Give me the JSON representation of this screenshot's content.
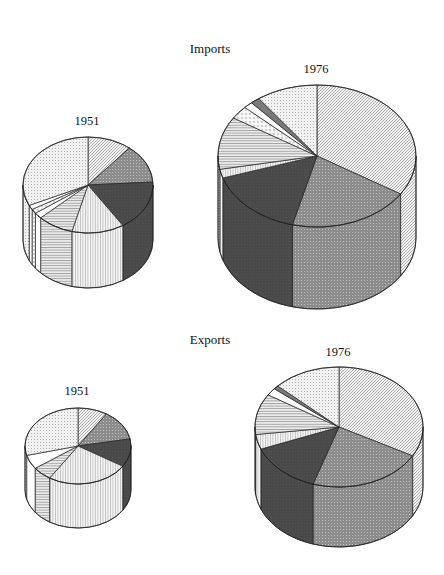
{
  "headings": {
    "imports": "Imports",
    "exports": "Exports"
  },
  "patterns": {
    "diagonal": {
      "name": "diagonal-hatch",
      "fill": "#f4f4f4",
      "stroke": "#7a7a7a"
    },
    "gray_dots": {
      "name": "gray-dotted",
      "fill": "#8c8c8c",
      "stroke": "#5a5a5a"
    },
    "dark": {
      "name": "dark-dotted",
      "fill": "#4a4a4a",
      "stroke": "#333333"
    },
    "vertical": {
      "name": "vertical-lines",
      "fill": "#f6f6f6",
      "stroke": "#8a8a8a"
    },
    "horizontal": {
      "name": "horizontal-lines",
      "fill": "#ececec",
      "stroke": "#6e6e6e"
    },
    "white": {
      "name": "white",
      "fill": "#ffffff",
      "stroke": "#ffffff"
    },
    "light_dots": {
      "name": "light-dotted",
      "fill": "#f2f2f2",
      "stroke": "#9a9a9a"
    },
    "sparse_dots": {
      "name": "sparse-dotted",
      "fill": "#f7f7f7",
      "stroke": "#9a9a9a"
    },
    "gray_solid": {
      "name": "gray-solid",
      "fill": "#7a7a7a",
      "stroke": "#7a7a7a"
    }
  },
  "chart_data": [
    {
      "type": "pie",
      "group": "Imports",
      "title": "1951",
      "style": "3d-cylinder",
      "geometry": {
        "cx": 88,
        "cy": 185,
        "rx": 65,
        "ry": 48,
        "depth": 55,
        "label_x": 87,
        "label_y": 114
      },
      "slices": [
        {
          "pattern": "diagonal",
          "value": 11
        },
        {
          "pattern": "gray_dots",
          "value": 13
        },
        {
          "pattern": "dark",
          "value": 17
        },
        {
          "pattern": "vertical",
          "value": 13
        },
        {
          "pattern": "horizontal",
          "value": 9
        },
        {
          "pattern": "white",
          "value": 2
        },
        {
          "pattern": "sparse_dots",
          "value": 1.5
        },
        {
          "pattern": "white",
          "value": 1.5
        },
        {
          "pattern": "light_dots",
          "value": 32
        }
      ]
    },
    {
      "type": "pie",
      "group": "Imports",
      "title": "1976",
      "style": "3d-cylinder",
      "geometry": {
        "cx": 317,
        "cy": 156,
        "rx": 99,
        "ry": 71,
        "depth": 82,
        "label_x": 316,
        "label_y": 62
      },
      "slices": [
        {
          "pattern": "diagonal",
          "value": 34
        },
        {
          "pattern": "gray_dots",
          "value": 20
        },
        {
          "pattern": "dark",
          "value": 16
        },
        {
          "pattern": "vertical",
          "value": 2
        },
        {
          "pattern": "horizontal",
          "value": 12
        },
        {
          "pattern": "sparse_dots",
          "value": 3
        },
        {
          "pattern": "white",
          "value": 1.5
        },
        {
          "pattern": "gray_solid",
          "value": 1.5
        },
        {
          "pattern": "light_dots",
          "value": 10
        }
      ]
    },
    {
      "type": "pie",
      "group": "Exports",
      "title": "1951",
      "style": "3d-cylinder",
      "geometry": {
        "cx": 78,
        "cy": 446,
        "rx": 53,
        "ry": 38,
        "depth": 44,
        "label_x": 77,
        "label_y": 384
      },
      "slices": [
        {
          "pattern": "diagonal",
          "value": 9
        },
        {
          "pattern": "gray_dots",
          "value": 13
        },
        {
          "pattern": "dark",
          "value": 12
        },
        {
          "pattern": "vertical",
          "value": 25
        },
        {
          "pattern": "horizontal",
          "value": 6
        },
        {
          "pattern": "white",
          "value": 6
        },
        {
          "pattern": "light_dots",
          "value": 29
        }
      ]
    },
    {
      "type": "pie",
      "group": "Exports",
      "title": "1976",
      "style": "3d-cylinder",
      "geometry": {
        "cx": 339,
        "cy": 427,
        "rx": 84,
        "ry": 60,
        "depth": 60,
        "label_x": 338,
        "label_y": 345
      },
      "slices": [
        {
          "pattern": "diagonal",
          "value": 33
        },
        {
          "pattern": "gray_dots",
          "value": 22
        },
        {
          "pattern": "dark",
          "value": 14
        },
        {
          "pattern": "vertical",
          "value": 4
        },
        {
          "pattern": "horizontal",
          "value": 11
        },
        {
          "pattern": "white",
          "value": 2
        },
        {
          "pattern": "gray_solid",
          "value": 1
        },
        {
          "pattern": "light_dots",
          "value": 13
        }
      ]
    }
  ]
}
